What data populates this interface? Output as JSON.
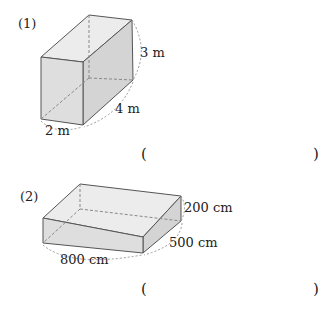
{
  "problems": [
    {
      "label": "(1)",
      "dims": {
        "height": "3 m",
        "depth": "4 m",
        "width": "2 m"
      },
      "answer": {
        "open": "(",
        "close": ")",
        "value": ""
      }
    },
    {
      "label": "(2)",
      "dims": {
        "height": "200 cm",
        "depth": "500 cm",
        "width": "800 cm"
      },
      "answer": {
        "open": "(",
        "close": ")",
        "value": ""
      }
    }
  ],
  "colors": {
    "face": "#dcdcdc",
    "side": "#cfcfcf",
    "edge": "#555555",
    "dash": "#888888"
  }
}
